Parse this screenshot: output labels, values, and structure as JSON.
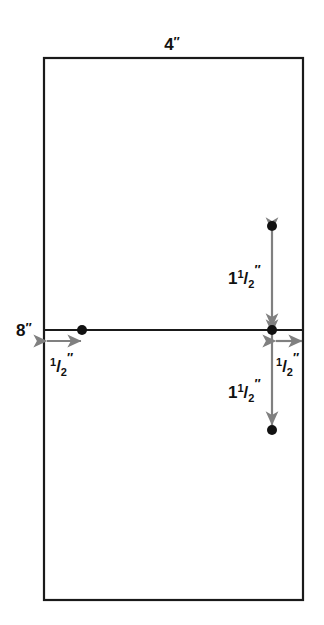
{
  "diagram": {
    "units": "inches",
    "colors": {
      "outline": "#1a1a1a",
      "divider": "#1a1a1a",
      "arrow": "#808080",
      "dot": "#111111",
      "label_text": "#111111",
      "background": "#ffffff"
    },
    "shape": {
      "name": "rectangle",
      "x": 44,
      "y": 58,
      "width": 259,
      "height": 542,
      "stroke_width": 2.2
    },
    "divider": {
      "name": "horizontal-center-line",
      "x1": 44,
      "y1": 330,
      "x2": 303,
      "y2": 330,
      "stroke_width": 2.2
    },
    "points": [
      {
        "name": "left-hole-point",
        "cx": 82,
        "cy": 330,
        "r": 5
      },
      {
        "name": "center-hole-point",
        "cx": 272,
        "cy": 330,
        "r": 5
      },
      {
        "name": "top-hole-point",
        "cx": 272,
        "cy": 226,
        "r": 5
      },
      {
        "name": "bottom-hole-point",
        "cx": 272,
        "cy": 430,
        "r": 5
      }
    ],
    "labels": {
      "top_width": {
        "text": "4″",
        "value": "4",
        "unit": "″",
        "x": 172,
        "y": 50,
        "anchor": "middle"
      },
      "left_height": {
        "text": "8″",
        "value": "8",
        "unit": "″",
        "x": 26,
        "y": 336,
        "anchor": "middle"
      },
      "left_offset": {
        "whole": "",
        "numerator": "1",
        "denominator": "2",
        "unit": "″",
        "text": "½″",
        "x": 50,
        "y": 372
      },
      "right_offset": {
        "whole": "",
        "numerator": "1",
        "denominator": "2",
        "unit": "″",
        "text": "½″",
        "x": 277,
        "y": 372
      },
      "upper_spacing": {
        "whole": "1",
        "numerator": "1",
        "denominator": "2",
        "unit": "″",
        "text": "1½″",
        "x": 228,
        "y": 284
      },
      "lower_spacing": {
        "whole": "1",
        "numerator": "1",
        "denominator": "2",
        "unit": "″",
        "text": "1½″",
        "x": 228,
        "y": 398
      }
    },
    "arrows": [
      {
        "name": "left-offset-arrow",
        "orientation": "horizontal",
        "double_headed": true,
        "x1": 47,
        "y1": 341,
        "x2": 81,
        "y2": 341,
        "measures": "½″"
      },
      {
        "name": "right-offset-arrow",
        "orientation": "horizontal",
        "double_headed": true,
        "x1": 275,
        "y1": 341,
        "x2": 302,
        "y2": 341,
        "measures": "½″"
      },
      {
        "name": "upper-spacing-arrow",
        "orientation": "vertical",
        "double_headed": true,
        "x1": 272,
        "y1": 231,
        "x2": 272,
        "y2": 327,
        "measures": "1½″"
      },
      {
        "name": "lower-spacing-arrow",
        "orientation": "vertical",
        "double_headed": true,
        "x1": 272,
        "y1": 333,
        "x2": 272,
        "y2": 425,
        "measures": "1½″"
      }
    ]
  }
}
